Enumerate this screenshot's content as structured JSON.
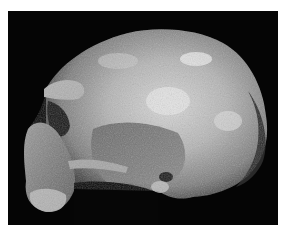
{
  "image": {
    "subject": "fossil hominin skull, left lateral view",
    "style": "grayscale photograph",
    "background_color": "#050505",
    "border_color": "#ffffff"
  }
}
